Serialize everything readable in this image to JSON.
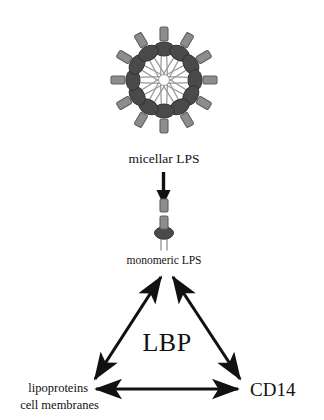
{
  "figure": {
    "title_visible": false,
    "background_color": "#ffffff",
    "ink_color": "#111111"
  },
  "labels": {
    "micellar_lps": "micellar LPS",
    "monomeric_lps": "monomeric LPS",
    "lbp": "LBP",
    "cd14": "CD14",
    "lipoproteins": "lipoproteins",
    "cell_membranes": "cell membranes"
  },
  "glyph_colors": {
    "o_antigen_fill": "#8d8d8d",
    "o_antigen_stroke": "#5e5e5e",
    "core_head_fill": "#4a4a4a",
    "core_head_stroke": "#343434",
    "acyl_tail_stroke": "#9a9a9a"
  },
  "micelle": {
    "center_x": 164,
    "center_y": 80,
    "unit_count": 12,
    "angle_step_deg": 30,
    "head_radius": 30,
    "description": "radial aggregate of LPS monomers with lipid tails pointing inward"
  },
  "monomer": {
    "center_x": 164,
    "center_y": 228,
    "segment_count": 2,
    "tail_count": 2
  },
  "conversion_arrow": {
    "from": "micellar LPS",
    "to": "monomeric LPS",
    "direction": "down"
  },
  "triangle": {
    "apex_label": "monomeric LPS",
    "left_label": "lipoproteins / cell membranes",
    "right_label": "CD14",
    "center_label": "LBP",
    "edges": [
      {
        "name": "lps-lipoproteins",
        "arrowheads": "both"
      },
      {
        "name": "lps-cd14",
        "arrowheads": "both"
      },
      {
        "name": "lipoproteins-cd14",
        "arrowheads": "both"
      }
    ]
  }
}
